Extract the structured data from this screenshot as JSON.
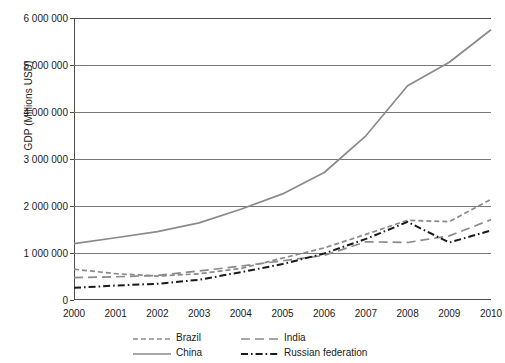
{
  "chart_data": {
    "type": "line",
    "title": "",
    "xlabel": "",
    "ylabel": "GDP (Millions USD)",
    "x": [
      2000,
      2001,
      2002,
      2003,
      2004,
      2005,
      2006,
      2007,
      2008,
      2009,
      2010
    ],
    "categories": [
      "2000",
      "2001",
      "2002",
      "2003",
      "2004",
      "2005",
      "2006",
      "2007",
      "2008",
      "2009",
      "2010"
    ],
    "xlim": [
      2000,
      2010
    ],
    "ylim": [
      0,
      6000000
    ],
    "ytick_values": [
      0,
      1000000,
      2000000,
      3000000,
      4000000,
      5000000,
      6000000
    ],
    "ytick_labels": [
      "0",
      "1 000 000",
      "2 000 000",
      "3 000 000",
      "4 000 000",
      "5 000 000",
      "6 000 000"
    ],
    "grid": "horizontal",
    "legend_position": "bottom",
    "series": [
      {
        "name": "Brazil",
        "style": "dashed",
        "color": "#8a8a8a",
        "values": [
          655000,
          560000,
          510000,
          558000,
          670000,
          892000,
          1108000,
          1397000,
          1696000,
          1667000,
          2143000
        ]
      },
      {
        "name": "China",
        "style": "solid",
        "color": "#8a8a8a",
        "values": [
          1198000,
          1325000,
          1454000,
          1641000,
          1932000,
          2257000,
          2713000,
          3494000,
          4558000,
          5059000,
          5750000
        ]
      },
      {
        "name": "India",
        "style": "long-dash",
        "color": "#8a8a8a",
        "values": [
          477000,
          494000,
          523000,
          618000,
          721000,
          834000,
          949000,
          1239000,
          1224000,
          1365000,
          1709000
        ]
      },
      {
        "name": "Russian federation",
        "style": "dash-dot",
        "color": "#1a1a1a",
        "values": [
          260000,
          307000,
          345000,
          430000,
          591000,
          764000,
          990000,
          1300000,
          1661000,
          1223000,
          1480000
        ]
      }
    ]
  },
  "legend": {
    "items": [
      {
        "label": "Brazil",
        "swatch": "brazil-dashed-swatch"
      },
      {
        "label": "India",
        "swatch": "india-longdash-swatch"
      },
      {
        "label": "China",
        "swatch": "china-solid-swatch"
      },
      {
        "label": "Russian federation",
        "swatch": "russia-dashdot-swatch"
      }
    ]
  },
  "colors": {
    "gray_series": "#8a8a8a",
    "black_series": "#1a1a1a",
    "gridline": "#777777",
    "axis": "#4d4d4d",
    "background": "#ffffff"
  }
}
